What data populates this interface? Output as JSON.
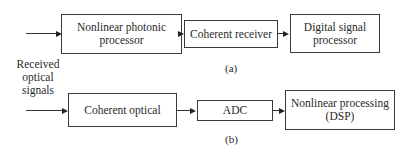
{
  "diagram": {
    "input_label": [
      "Received",
      "optical",
      "signals"
    ],
    "a": {
      "caption": "(a)",
      "blocks": [
        {
          "label": [
            "Nonlinear photonic",
            "processor"
          ]
        },
        {
          "label": [
            "Coherent receiver"
          ]
        },
        {
          "label": [
            "Digital signal",
            "processor"
          ]
        }
      ]
    },
    "b": {
      "caption": "(b)",
      "blocks": [
        {
          "label": [
            "Coherent optical"
          ]
        },
        {
          "label": [
            "ADC"
          ]
        },
        {
          "label": [
            "Nonlinear processing",
            "(DSP)"
          ]
        }
      ]
    }
  }
}
